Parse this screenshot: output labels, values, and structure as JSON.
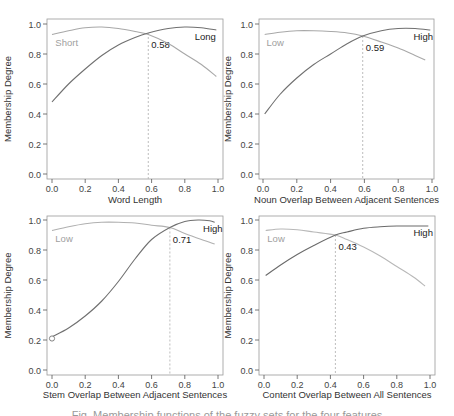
{
  "figure": {
    "caption": "Fig. Membership functions of the fuzzy sets for the four features"
  },
  "chart_data": [
    {
      "type": "line",
      "title": "",
      "xlabel": "Word Length",
      "ylabel": "Membership Degree",
      "xlim": [
        0.0,
        1.0
      ],
      "ylim": [
        0.0,
        1.0
      ],
      "xticks": [
        "0.0",
        "0.2",
        "0.4",
        "0.6",
        "0.8",
        "1.0"
      ],
      "yticks": [
        "0.0",
        "0.2",
        "0.4",
        "0.6",
        "0.8",
        "1.0"
      ],
      "grid": false,
      "crossover": 0.58,
      "crossover_label": "0.58",
      "crossover_y": 0.94,
      "series": [
        {
          "name": "Short",
          "color": "#a8a8a8",
          "label_pos": [
            0.02,
            0.88
          ],
          "x": [
            0.0,
            0.1,
            0.2,
            0.3,
            0.4,
            0.5,
            0.58,
            0.7,
            0.8,
            0.9,
            0.99
          ],
          "values": [
            0.93,
            0.955,
            0.975,
            0.98,
            0.97,
            0.95,
            0.93,
            0.87,
            0.8,
            0.73,
            0.65
          ]
        },
        {
          "name": "Long",
          "color": "#707070",
          "label_pos": [
            0.86,
            0.92
          ],
          "x": [
            0.0,
            0.1,
            0.2,
            0.3,
            0.4,
            0.5,
            0.58,
            0.7,
            0.8,
            0.9,
            0.99
          ],
          "values": [
            0.48,
            0.6,
            0.7,
            0.79,
            0.86,
            0.91,
            0.94,
            0.97,
            0.98,
            0.975,
            0.96
          ]
        }
      ]
    },
    {
      "type": "line",
      "title": "",
      "xlabel": "Noun Overlap Between Adjacent Sentences",
      "ylabel": "Membership Degree",
      "xlim": [
        0.0,
        1.0
      ],
      "ylim": [
        0.0,
        1.0
      ],
      "xticks": [
        "0.0",
        "0.2",
        "0.4",
        "0.6",
        "0.8",
        "1.0"
      ],
      "yticks": [
        "0.0",
        "0.2",
        "0.4",
        "0.6",
        "0.8",
        "1.0"
      ],
      "grid": false,
      "crossover": 0.59,
      "crossover_label": "0.59",
      "crossover_y": 0.92,
      "series": [
        {
          "name": "Low",
          "color": "#a8a8a8",
          "label_pos": [
            0.02,
            0.88
          ],
          "x": [
            0.01,
            0.1,
            0.2,
            0.3,
            0.4,
            0.5,
            0.59,
            0.7,
            0.8,
            0.9,
            0.96
          ],
          "values": [
            0.93,
            0.945,
            0.955,
            0.955,
            0.95,
            0.94,
            0.92,
            0.88,
            0.84,
            0.79,
            0.76
          ]
        },
        {
          "name": "High",
          "color": "#707070",
          "label_pos": [
            0.89,
            0.92
          ],
          "x": [
            0.01,
            0.1,
            0.2,
            0.3,
            0.4,
            0.5,
            0.59,
            0.7,
            0.8,
            0.9,
            0.99
          ],
          "values": [
            0.4,
            0.53,
            0.64,
            0.73,
            0.8,
            0.87,
            0.92,
            0.955,
            0.97,
            0.97,
            0.96
          ]
        }
      ]
    },
    {
      "type": "line",
      "title": "",
      "xlabel": "Stem Overlap Between Adjacent Sentences",
      "ylabel": "Membership Degree",
      "xlim": [
        0.0,
        1.0
      ],
      "ylim": [
        0.0,
        1.0
      ],
      "xticks": [
        "0.0",
        "0.2",
        "0.4",
        "0.6",
        "0.8",
        "1.0"
      ],
      "yticks": [
        "0.0",
        "0.2",
        "0.4",
        "0.6",
        "0.8",
        "1.0"
      ],
      "grid": false,
      "crossover": 0.71,
      "crossover_label": "0.71",
      "crossover_y": 0.95,
      "open_point": [
        0.0,
        0.21
      ],
      "series": [
        {
          "name": "Low",
          "color": "#b0b0b0",
          "label_pos": [
            0.02,
            0.88
          ],
          "x": [
            0.0,
            0.1,
            0.2,
            0.3,
            0.4,
            0.5,
            0.6,
            0.71,
            0.8,
            0.9,
            0.98
          ],
          "values": [
            0.93,
            0.955,
            0.975,
            0.985,
            0.985,
            0.98,
            0.965,
            0.95,
            0.91,
            0.87,
            0.84
          ]
        },
        {
          "name": "High",
          "color": "#707070",
          "label_pos": [
            0.91,
            0.95
          ],
          "x": [
            0.0,
            0.1,
            0.2,
            0.3,
            0.4,
            0.5,
            0.6,
            0.71,
            0.8,
            0.88,
            0.95,
            0.98
          ],
          "values": [
            0.22,
            0.28,
            0.36,
            0.46,
            0.59,
            0.74,
            0.87,
            0.95,
            0.99,
            1.0,
            0.995,
            0.985
          ]
        }
      ]
    },
    {
      "type": "line",
      "title": "",
      "xlabel": "Content Overlap Between All Sentences",
      "ylabel": "Membership Degree",
      "xlim": [
        0.0,
        1.0
      ],
      "ylim": [
        0.0,
        1.0
      ],
      "xticks": [
        "0.0",
        "0.2",
        "0.4",
        "0.6",
        "0.8",
        "1.0"
      ],
      "yticks": [
        "0.0",
        "0.2",
        "0.4",
        "0.6",
        "0.8",
        "1.0"
      ],
      "grid": false,
      "crossover": 0.43,
      "crossover_label": "0.43",
      "crossover_y": 0.9,
      "series": [
        {
          "name": "Low",
          "color": "#b8b8b8",
          "label_pos": [
            0.02,
            0.88
          ],
          "x": [
            0.01,
            0.1,
            0.2,
            0.3,
            0.43,
            0.5,
            0.6,
            0.7,
            0.8,
            0.9,
            0.97
          ],
          "values": [
            0.93,
            0.94,
            0.935,
            0.92,
            0.9,
            0.87,
            0.82,
            0.76,
            0.69,
            0.62,
            0.56
          ]
        },
        {
          "name": "High",
          "color": "#6a6a6a",
          "label_pos": [
            0.9,
            0.92
          ],
          "x": [
            0.01,
            0.1,
            0.2,
            0.3,
            0.43,
            0.5,
            0.6,
            0.7,
            0.8,
            0.9,
            0.99
          ],
          "values": [
            0.63,
            0.7,
            0.77,
            0.83,
            0.9,
            0.92,
            0.945,
            0.955,
            0.96,
            0.96,
            0.96
          ]
        }
      ]
    }
  ]
}
